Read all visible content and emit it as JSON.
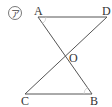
{
  "figure": {
    "marker": "ア",
    "points": {
      "A": {
        "label": "A",
        "x": 38,
        "y": 17
      },
      "D": {
        "label": "D",
        "x": 107,
        "y": 17
      },
      "O": {
        "label": "O",
        "x": 65,
        "y": 58
      },
      "C": {
        "label": "C",
        "x": 25,
        "y": 94
      },
      "B": {
        "label": "B",
        "x": 92,
        "y": 94
      }
    },
    "segments": [
      "AD",
      "AB",
      "DC",
      "CB"
    ],
    "line_color": "#555555",
    "arc_color": "#cccccc"
  }
}
